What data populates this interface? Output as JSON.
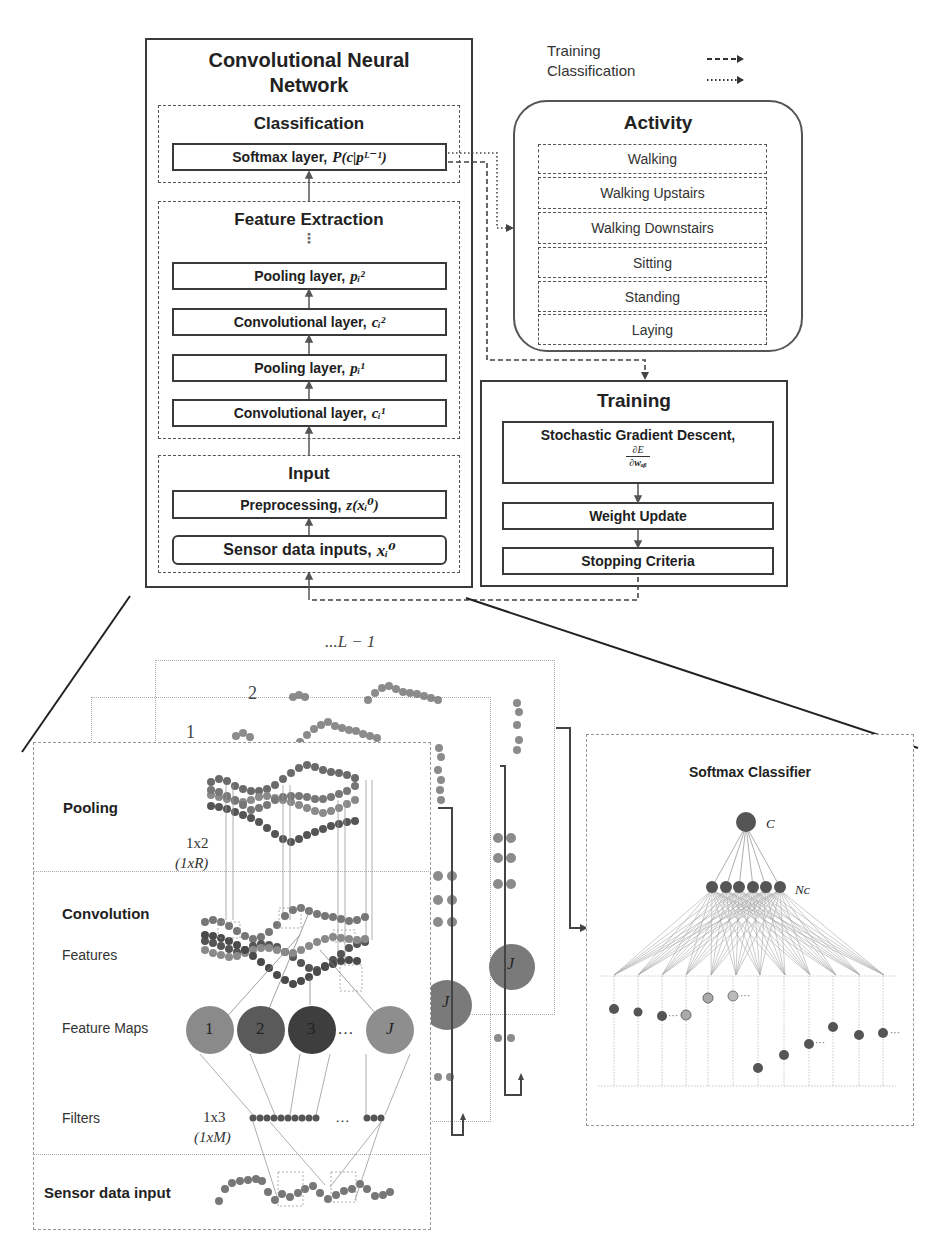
{
  "legend": {
    "items": [
      {
        "label": "Training",
        "style": "dashed-arrow"
      },
      {
        "label": "Classification",
        "style": "dotted-arrow"
      }
    ]
  },
  "cnn": {
    "title_line1": "Convolutional Neural",
    "title_line2": "Network",
    "classification": {
      "title": "Classification",
      "softmax": {
        "label": "Softmax layer,",
        "math": "P(c|pᴸ⁻¹)"
      }
    },
    "feature_extraction": {
      "title": "Feature Extraction",
      "ellipsis": "⋮",
      "layers": [
        {
          "label": "Pooling layer,",
          "math": "pᵢ²"
        },
        {
          "label": "Convolutional layer,",
          "math": "cᵢ²"
        },
        {
          "label": "Pooling layer,",
          "math": "pᵢ¹"
        },
        {
          "label": "Convolutional layer,",
          "math": "cᵢ¹"
        }
      ]
    },
    "input": {
      "title": "Input",
      "preprocessing": {
        "label": "Preprocessing,",
        "math": "z(xᵢ⁰)"
      },
      "sensor": {
        "label": "Sensor data inputs,",
        "math": "xᵢ⁰"
      }
    }
  },
  "activity": {
    "title": "Activity",
    "items": [
      "Walking",
      "Walking Upstairs",
      "Walking Downstairs",
      "Sitting",
      "Standing",
      "Laying"
    ]
  },
  "training": {
    "title": "Training",
    "sgd": {
      "label": "Stochastic Gradient Descent,",
      "numerator": "∂E",
      "denominator": "∂wₐᵦ"
    },
    "weight_update": "Weight Update",
    "stopping": "Stopping Criteria"
  },
  "detail": {
    "stack_labels": {
      "last": "...L − 1",
      "second": "2",
      "first": "1"
    },
    "sections": {
      "pooling": "Pooling",
      "pool_size": "1x2",
      "pool_size_general": "(1xR)",
      "convolution": "Convolution",
      "features": "Features",
      "feature_maps": "Feature Maps",
      "filters": "Filters",
      "filter_size": "1x3",
      "filter_size_general": "(1xM)",
      "sensor_input": "Sensor data input"
    },
    "feature_map_nodes": [
      "1",
      "2",
      "3",
      "…",
      "J"
    ],
    "stacked_node_label": "J",
    "ellipsis": "…"
  },
  "softmax_classifier": {
    "title": "Softmax Classifier",
    "output_label": "C",
    "hidden_label": "Nᴄ"
  },
  "colors": {
    "line": "#3a3a3a",
    "node_dark": "#4a4a4a",
    "node_mid": "#6e6e6e",
    "node_light": "#9a9a9a",
    "fm1": "#8a8a8a",
    "fm2": "#5a5a5a",
    "fm3": "#3e3e3e",
    "fmJ": "#8e8e8e"
  }
}
